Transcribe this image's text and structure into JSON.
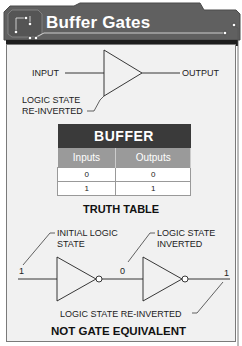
{
  "header": {
    "title": "Buffer Gates"
  },
  "buffer_symbol": {
    "input_label": "INPUT",
    "output_label": "OUTPUT",
    "annotation_line1": "LOGIC STATE",
    "annotation_line2": "RE-INVERTED"
  },
  "truth_table": {
    "title": "BUFFER",
    "columns": [
      "Inputs",
      "Outputs"
    ],
    "rows": [
      [
        "0",
        "0"
      ],
      [
        "1",
        "1"
      ]
    ],
    "caption": "TRUTH TABLE"
  },
  "not_gate_equivalent": {
    "initial_label_line1": "INITIAL LOGIC",
    "initial_label_line2": "STATE",
    "inverted_label_line1": "LOGIC STATE",
    "inverted_label_line2": "INVERTED",
    "reinverted_label": "LOGIC STATE RE-INVERTED",
    "value_initial": "1",
    "value_middle": "0",
    "value_final": "1",
    "caption": "NOT GATE EQUIVALENT"
  },
  "colors": {
    "header_bg": "#5f5f5f",
    "header_dark": "#1e1e1e",
    "panel_bg": "#f1f1f1",
    "table_head": "#3a3a3a",
    "table_sub": "#9a9a9a"
  }
}
